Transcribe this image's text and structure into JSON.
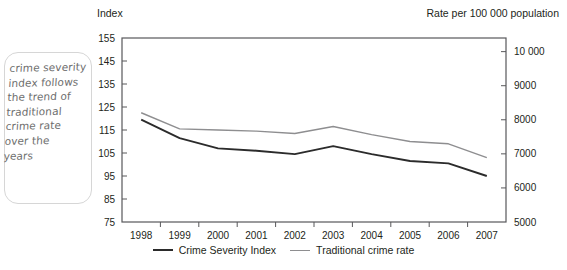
{
  "note": {
    "text": "crime severity\nindex follows\nthe trend of\ntraditional\ncrime rate\nover the\nyears"
  },
  "captions": {
    "left_axis_caption": "Index",
    "right_axis_caption": "Rate per 100 000 population"
  },
  "legend": {
    "items": [
      {
        "label": "Crime Severity Index",
        "color": "#2b2b2b"
      },
      {
        "label": "Traditional crime rate",
        "color": "#8e8e90"
      }
    ]
  },
  "chart_data": {
    "type": "line",
    "title": "",
    "xlabel": "",
    "ylabel": "Index",
    "y2label": "Rate per 100 000 population",
    "grid": false,
    "legend_position": "bottom",
    "categories": [
      "1998",
      "1999",
      "2000",
      "2001",
      "2002",
      "2003",
      "2004",
      "2005",
      "2006",
      "2007"
    ],
    "ylim": [
      75,
      155
    ],
    "yticks": [
      75,
      85,
      95,
      105,
      115,
      125,
      135,
      145,
      155
    ],
    "ytick_labels": [
      "75",
      "85",
      "95",
      "105",
      "115",
      "125",
      "135",
      "145",
      "155"
    ],
    "y2lim": [
      5000,
      10400
    ],
    "y2ticks": [
      5000,
      6000,
      7000,
      8000,
      9000,
      10000
    ],
    "y2tick_labels": [
      "5000",
      "6000",
      "7000",
      "8000",
      "9000",
      "10 000"
    ],
    "series": [
      {
        "name": "Crime Severity Index",
        "color": "#2b2b2b",
        "axis": "left",
        "values": [
          119.5,
          111.5,
          107.0,
          106.0,
          104.5,
          108.0,
          104.5,
          101.5,
          100.5,
          95.0
        ]
      },
      {
        "name": "Traditional crime rate",
        "color": "#8e8e90",
        "axis": "left",
        "values": [
          122.5,
          115.5,
          115.0,
          114.5,
          113.5,
          116.5,
          113.0,
          110.0,
          109.0,
          103.0
        ]
      }
    ],
    "series_right_axis_equivalent": [
      {
        "name": "Traditional crime rate (rate per 100 000)",
        "values": [
          8050,
          7600,
          7570,
          7540,
          7470,
          7670,
          7430,
          7230,
          7170,
          6770
        ]
      }
    ]
  }
}
